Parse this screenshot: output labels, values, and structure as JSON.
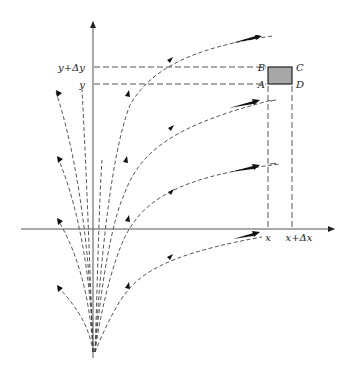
{
  "figure": {
    "type": "phase-plane flow diagram",
    "labels": {
      "y_plus_dy": "y+Δy",
      "y": "y",
      "x": "x",
      "x_plus_dx": "x+Δx",
      "corner_a": "A",
      "corner_b": "B",
      "corner_c": "C",
      "corner_d": "D"
    },
    "colors": {
      "box_fill": "#a8a8a8",
      "box_stroke": "#222222",
      "lines": "#444444",
      "arrows": "#111111"
    },
    "geometry": {
      "y_axis_x": 93,
      "x_axis_y": 229,
      "y_level": 84,
      "y_plus_dy_level": 67,
      "x_pos": 268,
      "x_plus_dx_pos": 292,
      "source_point": [
        93,
        355
      ]
    },
    "trajectories": [
      {
        "name": "right-curve-top",
        "direction": "outward-right"
      },
      {
        "name": "right-curve-2",
        "direction": "outward-right"
      },
      {
        "name": "right-curve-3",
        "direction": "outward-right"
      },
      {
        "name": "right-curve-below-axis",
        "direction": "outward-right"
      },
      {
        "name": "left-curve-upper",
        "direction": "outward-left"
      },
      {
        "name": "left-curve-middle",
        "direction": "outward-left"
      },
      {
        "name": "left-curve-near-axis",
        "direction": "outward-left"
      },
      {
        "name": "left-curve-lower",
        "direction": "outward-left"
      }
    ]
  }
}
